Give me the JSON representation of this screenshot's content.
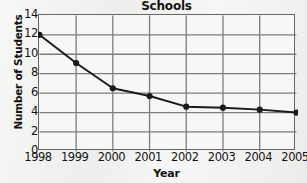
{
  "chart_data": {
    "type": "line",
    "title": "Schools",
    "xlabel": "Year",
    "ylabel": "Number of Students",
    "categories": [
      "1998",
      "1999",
      "2000",
      "2001",
      "2002",
      "2003",
      "2004",
      "2005"
    ],
    "values": [
      12.0,
      9.1,
      6.5,
      5.7,
      4.6,
      4.5,
      4.3,
      4.0
    ],
    "series": [
      {
        "name": "Number of Students",
        "values": [
          12.0,
          9.1,
          6.5,
          5.7,
          4.6,
          4.5,
          4.3,
          4.0
        ]
      }
    ],
    "ylim": [
      0,
      14
    ],
    "yticks": [
      "0",
      "2",
      "4",
      "6",
      "8",
      "10",
      "12",
      "14"
    ],
    "ytick_values": [
      0,
      2,
      4,
      6,
      8,
      10,
      12,
      14
    ],
    "xticks": [
      "1998",
      "1999",
      "2000",
      "2001",
      "2002",
      "2003",
      "2004",
      "2005"
    ],
    "grid": true,
    "grid_axes": "both",
    "legend": false,
    "legend_position": "none",
    "marker": "circle",
    "colors": {
      "line": "#1a1a1a",
      "marker": "#1a1a1a",
      "grid": "#7d7d7d",
      "axis": "#5a5a5a",
      "plot_background": "#f7f7f5",
      "page_background": "#efefee",
      "text": "#141414"
    }
  }
}
